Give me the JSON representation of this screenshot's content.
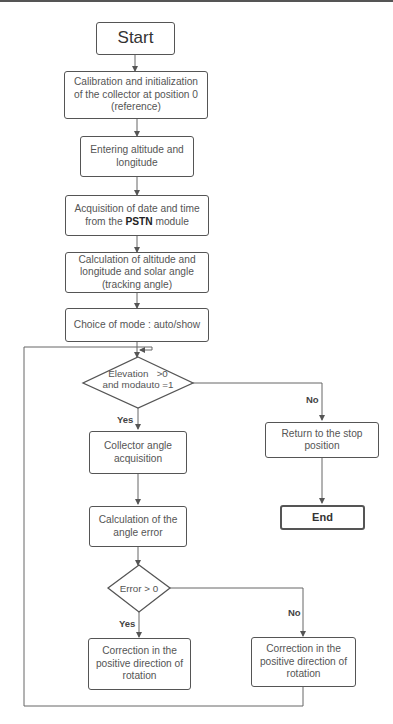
{
  "diagram": {
    "type": "flowchart",
    "nodes": {
      "start": {
        "label": "Start",
        "shape": "terminal"
      },
      "calibration": {
        "label": "Calibration and initialization of the collector at position 0 (reference)",
        "shape": "process"
      },
      "entering": {
        "label": "Entering altitude and longitude",
        "shape": "process"
      },
      "acquisition": {
        "label_pre": "Acquisition of date and time from the ",
        "label_bold": "PSTN",
        "label_post": " module",
        "shape": "process"
      },
      "calculation": {
        "label": "Calculation of altitude and longitude and solar angle (tracking angle)",
        "shape": "process"
      },
      "choice": {
        "label": "Choice of mode : auto/show",
        "shape": "process"
      },
      "decision1": {
        "line1": "Elevation   >0",
        "line2": "and modauto =1",
        "shape": "decision"
      },
      "collector_angle": {
        "label": "Collector angle acquisition",
        "shape": "process"
      },
      "angle_error": {
        "label": "Calculation of the angle error",
        "shape": "process"
      },
      "decision2": {
        "label": "Error > 0",
        "shape": "decision"
      },
      "correction_yes": {
        "label": "Correction in the positive direction of rotation",
        "shape": "process"
      },
      "correction_no": {
        "label": "Correction in the positive direction of rotation",
        "shape": "process"
      },
      "return_stop": {
        "label": "Return to the stop position",
        "shape": "process"
      },
      "end": {
        "label": "End",
        "shape": "terminal"
      }
    },
    "edges": [
      {
        "from": "start",
        "to": "calibration"
      },
      {
        "from": "calibration",
        "to": "entering"
      },
      {
        "from": "entering",
        "to": "acquisition"
      },
      {
        "from": "acquisition",
        "to": "calculation"
      },
      {
        "from": "calculation",
        "to": "choice"
      },
      {
        "from": "choice",
        "to": "decision1"
      },
      {
        "from": "decision1",
        "to": "collector_angle",
        "label": "Yes"
      },
      {
        "from": "decision1",
        "to": "return_stop",
        "label": "No"
      },
      {
        "from": "return_stop",
        "to": "end"
      },
      {
        "from": "collector_angle",
        "to": "angle_error"
      },
      {
        "from": "angle_error",
        "to": "decision2"
      },
      {
        "from": "decision2",
        "to": "correction_yes",
        "label": "Yes"
      },
      {
        "from": "decision2",
        "to": "correction_no",
        "label": "No"
      },
      {
        "from": "correction_no",
        "to": "decision1",
        "label": "loop back"
      }
    ],
    "edge_labels": {
      "yes": "Yes",
      "no": "No"
    }
  }
}
